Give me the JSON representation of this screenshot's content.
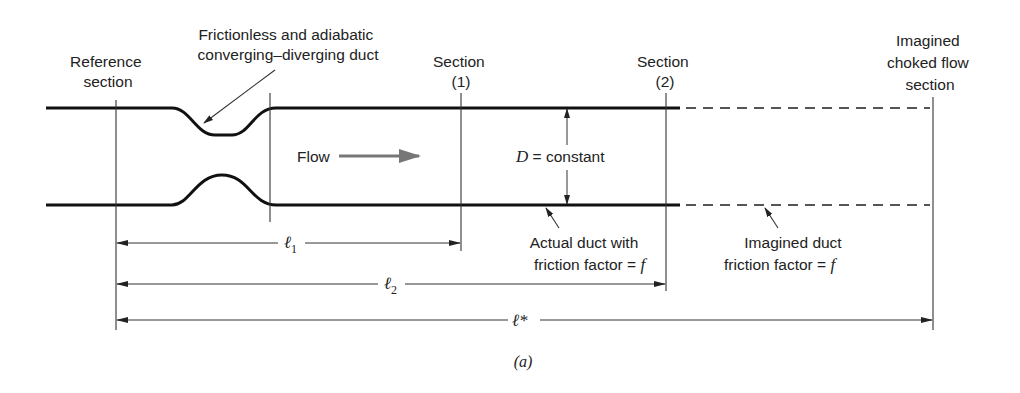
{
  "labels": {
    "reference_section": [
      "Reference",
      "section"
    ],
    "nozzle": [
      "Frictionless and adiabatic",
      "converging–diverging duct"
    ],
    "section1": [
      "Section",
      "(1)"
    ],
    "section2": [
      "Section",
      "(2)"
    ],
    "choked": [
      "Imagined",
      "choked flow",
      "section"
    ],
    "flow": "Flow",
    "diameter_symbol": "D",
    "diameter_text": " = constant",
    "actual_duct": [
      "Actual duct with",
      "friction factor = "
    ],
    "imagined_duct": [
      "Imagined duct",
      "friction factor = "
    ],
    "friction_symbol": "f",
    "l1_symbol": "ℓ",
    "l1_sub": "1",
    "l2_symbol": "ℓ",
    "l2_sub": "2",
    "lstar": "ℓ*",
    "caption": "(a)"
  },
  "colors": {
    "line": "#111111",
    "flow_arrow": "#777777",
    "dashed": "#555555"
  }
}
